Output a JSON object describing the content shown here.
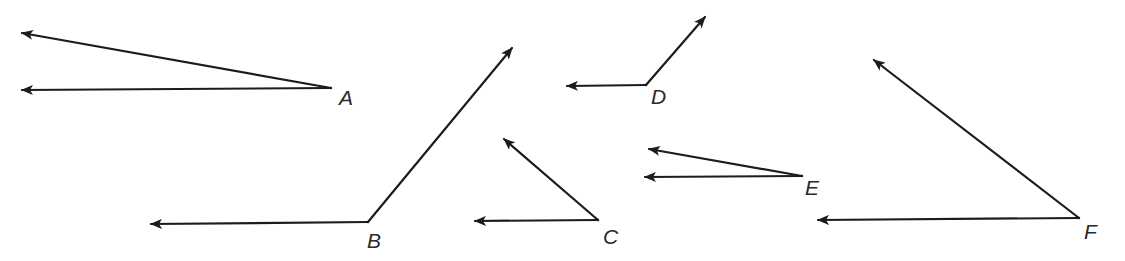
{
  "colors": {
    "ink": "#1c1c1c",
    "label": "#2a2a2a",
    "background": "#ffffff"
  },
  "angles": [
    {
      "label": "A",
      "rays": [
        "left",
        "left-slightly-up"
      ],
      "type": "acute",
      "approx_degrees": 10
    },
    {
      "label": "B",
      "rays": [
        "left",
        "up-right"
      ],
      "type": "obtuse",
      "approx_degrees": 127
    },
    {
      "label": "C",
      "rays": [
        "left",
        "up-left"
      ],
      "type": "acute",
      "approx_degrees": 41
    },
    {
      "label": "D",
      "rays": [
        "left",
        "up-right"
      ],
      "type": "obtuse",
      "approx_degrees": 130
    },
    {
      "label": "E",
      "rays": [
        "left",
        "left-slightly-up"
      ],
      "type": "acute",
      "approx_degrees": 10
    },
    {
      "label": "F",
      "rays": [
        "left",
        "up-left"
      ],
      "type": "acute",
      "approx_degrees": 39
    }
  ]
}
